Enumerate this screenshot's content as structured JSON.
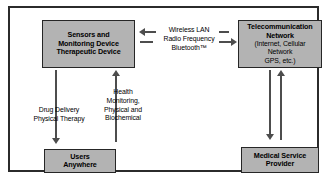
{
  "diagram": {
    "colors": {
      "node_fill": "#b3b3b3",
      "node_border": "#262626",
      "frame_border": "#2b2b2b",
      "connector": "#4d4d4d",
      "background": "#ffffff",
      "text": "#000000"
    },
    "nodes": [
      {
        "id": "sensors",
        "lines": [
          "Sensors and",
          "Monitoring Device",
          "Therapeutic Device"
        ]
      },
      {
        "id": "telecom",
        "title_lines": [
          "Telecommunication",
          "Network"
        ],
        "sub_lines": [
          "(Internet, Cellular",
          "Network",
          "GPS, etc.)"
        ]
      },
      {
        "id": "users",
        "lines": [
          "Users",
          "Anywhere"
        ]
      },
      {
        "id": "provider",
        "lines": [
          "Medical Service",
          "Provider"
        ]
      }
    ],
    "edges": [
      {
        "id": "wireless",
        "from": "sensors",
        "to": "telecom",
        "direction": "bidirectional",
        "lines": [
          "Wireless LAN",
          "Radio Frequency",
          "Bluetooth™"
        ]
      },
      {
        "id": "drug-delivery",
        "from": "sensors",
        "to": "users",
        "direction": "down",
        "lines": [
          "Drug Delivery",
          "Physical Therapy"
        ]
      },
      {
        "id": "health-monitoring",
        "from": "users",
        "to": "sensors",
        "direction": "up",
        "lines": [
          "Health",
          "Monitoring,",
          "Physical and",
          "Biochemical"
        ]
      },
      {
        "id": "telecom-provider",
        "from": "telecom",
        "to": "provider",
        "direction": "bidirectional",
        "lines": []
      }
    ]
  }
}
